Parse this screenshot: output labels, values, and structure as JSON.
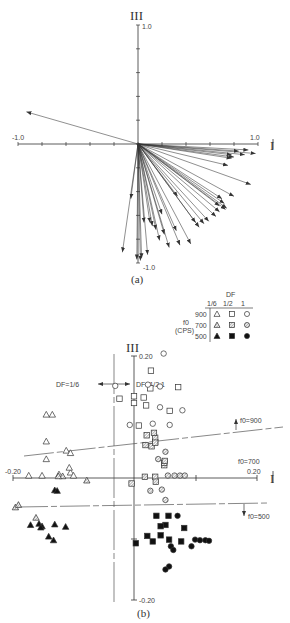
{
  "chart_data": [
    {
      "type": "vector",
      "panel": "(a)",
      "caption": "(a)",
      "xlabel": "I",
      "ylabel": "III",
      "xlim": [
        -1.0,
        1.0
      ],
      "ylim": [
        -1.0,
        1.0
      ],
      "x_ticks": [
        "-1.0",
        "1.0"
      ],
      "y_ticks": [
        "1.0",
        "-1.0"
      ],
      "tick_step": 0.2,
      "grid": false,
      "vectors": [
        [
          -0.93,
          0.27
        ],
        [
          0.92,
          -0.05
        ],
        [
          0.98,
          -0.08
        ],
        [
          0.84,
          -0.06
        ],
        [
          0.89,
          -0.09
        ],
        [
          0.78,
          -0.09
        ],
        [
          0.8,
          -0.11
        ],
        [
          0.78,
          -0.12
        ],
        [
          0.75,
          -0.18
        ],
        [
          0.94,
          -0.34
        ],
        [
          0.8,
          -0.44
        ],
        [
          0.7,
          -0.46
        ],
        [
          0.72,
          -0.5
        ],
        [
          0.73,
          -0.55
        ],
        [
          0.68,
          -0.52
        ],
        [
          0.74,
          -0.54
        ],
        [
          0.68,
          -0.57
        ],
        [
          0.65,
          -0.61
        ],
        [
          0.59,
          -0.65
        ],
        [
          0.55,
          -0.67
        ],
        [
          0.51,
          -0.7
        ],
        [
          0.48,
          -0.66
        ],
        [
          0.32,
          -0.73
        ],
        [
          0.26,
          -0.87
        ],
        [
          0.44,
          -0.84
        ],
        [
          0.35,
          -0.85
        ],
        [
          0.22,
          -0.76
        ],
        [
          0.18,
          -0.81
        ],
        [
          0.08,
          -0.93
        ],
        [
          0.05,
          -0.66
        ],
        [
          0.1,
          -0.66
        ],
        [
          0.12,
          -0.69
        ],
        [
          0.02,
          -0.98
        ],
        [
          0.03,
          -0.96
        ],
        [
          -0.01,
          -0.97
        ],
        [
          -0.06,
          -0.46
        ],
        [
          -0.13,
          -0.91
        ],
        [
          0.2,
          -0.59
        ],
        [
          0.33,
          -0.44
        ],
        [
          0.15,
          -0.72
        ]
      ]
    },
    {
      "type": "scatter",
      "panel": "(b)",
      "caption": "(b)",
      "xlabel": "I",
      "ylabel": "III",
      "xlim": [
        -0.2,
        0.2
      ],
      "ylim": [
        -0.2,
        0.2
      ],
      "x_ticks": [
        "-0.20",
        "0.20"
      ],
      "y_ticks": [
        "0.20",
        "-0.20"
      ],
      "grid": false,
      "legend": {
        "title_col": "DF",
        "title_row": "f0 (CPS)",
        "columns": [
          "1/6",
          "1/2",
          "1"
        ],
        "rows": [
          "900",
          "700",
          "500"
        ],
        "markers": {
          "1/6": "triangle",
          "1/2": "square",
          "1": "circle"
        },
        "fills": {
          "900": "open",
          "700": "hatched",
          "500": "filled"
        },
        "position": "upper right"
      },
      "annotations": [
        {
          "text": "DF=1/6",
          "type": "boundary-label"
        },
        {
          "text": "DF=1/2,1",
          "type": "boundary-label"
        },
        {
          "text": "f0=900",
          "type": "boundary-label"
        },
        {
          "text": "f0=700",
          "type": "boundary-label"
        },
        {
          "text": "f0=500",
          "type": "boundary-label"
        }
      ],
      "series": [
        {
          "name": "DF 1/6, f0 900",
          "marker": "triangle",
          "fill": "open",
          "points": [
            [
              -0.145,
              0.104
            ],
            [
              -0.135,
              0.104
            ],
            [
              -0.145,
              0.06
            ],
            [
              -0.112,
              0.045
            ],
            [
              -0.105,
              0.041
            ],
            [
              -0.145,
              0.031
            ],
            [
              -0.105,
              0.009
            ],
            [
              -0.107,
              0.017
            ],
            [
              -0.152,
              0.004
            ],
            [
              -0.124,
              0.006
            ],
            [
              -0.174,
              0.004
            ],
            [
              -0.1,
              0.004
            ]
          ]
        },
        {
          "name": "DF 1/6, f0 700",
          "marker": "triangle",
          "fill": "hatched",
          "points": [
            [
              -0.118,
              0.003
            ],
            [
              -0.125,
              0.003
            ],
            [
              -0.078,
              -0.004
            ],
            [
              -0.196,
              -0.048
            ],
            [
              -0.191,
              -0.044
            ],
            [
              -0.162,
              -0.065
            ]
          ]
        },
        {
          "name": "DF 1/6, f0 500",
          "marker": "triangle",
          "fill": "filled",
          "points": [
            [
              -0.131,
              -0.02
            ],
            [
              -0.127,
              -0.021
            ],
            [
              -0.171,
              -0.077
            ],
            [
              -0.157,
              -0.075
            ],
            [
              -0.152,
              -0.079
            ],
            [
              -0.131,
              -0.076
            ],
            [
              -0.113,
              -0.08
            ],
            [
              -0.133,
              -0.102
            ],
            [
              -0.141,
              -0.096
            ],
            [
              -0.154,
              -0.081
            ]
          ]
        },
        {
          "name": "DF 1/2, f0 900",
          "marker": "square",
          "fill": "open",
          "points": [
            [
              0.028,
              0.176
            ],
            [
              0.073,
              0.149
            ],
            [
              0.027,
              0.147
            ],
            [
              0.016,
              0.132
            ],
            [
              0.0,
              0.123
            ],
            [
              0.0,
              0.134
            ],
            [
              -0.024,
              0.13
            ],
            [
              0.02,
              0.119
            ],
            [
              0.059,
              0.11
            ],
            [
              0.008,
              0.086
            ]
          ]
        },
        {
          "name": "DF 1/2, f0 700",
          "marker": "square",
          "fill": "hatched",
          "points": [
            [
              0.021,
              0.07
            ],
            [
              0.035,
              0.059
            ],
            [
              0.035,
              0.066
            ],
            [
              0.033,
              0.074
            ],
            [
              0.019,
              0.054
            ],
            [
              0.029,
              0.052
            ],
            [
              0.035,
              0.058
            ],
            [
              0.035,
              0.002
            ],
            [
              0.018,
              0.002
            ],
            [
              0.05,
              0.021
            ],
            [
              0.05,
              0.025
            ],
            [
              0.051,
              0.028
            ],
            [
              0.036,
              -0.006
            ],
            [
              -0.004,
              -0.009
            ]
          ]
        },
        {
          "name": "DF 1/2, f0 500",
          "marker": "square",
          "fill": "filled",
          "points": [
            [
              0.037,
              -0.062
            ],
            [
              0.057,
              -0.062
            ],
            [
              0.052,
              -0.077
            ],
            [
              0.044,
              -0.079
            ],
            [
              0.044,
              -0.094
            ],
            [
              0.022,
              -0.095
            ],
            [
              0.078,
              -0.104
            ],
            [
              0.031,
              -0.104
            ],
            [
              0.058,
              -0.101
            ],
            [
              0.003,
              -0.107
            ],
            [
              0.083,
              -0.082
            ]
          ]
        },
        {
          "name": "DF 1, f0 900",
          "marker": "circle",
          "fill": "open",
          "points": [
            [
              0.049,
              0.204
            ],
            [
              0.043,
              0.15
            ],
            [
              0.023,
              0.153
            ],
            [
              -0.031,
              0.151
            ],
            [
              0.043,
              0.116
            ],
            [
              0.08,
              0.111
            ],
            [
              0.059,
              0.087
            ],
            [
              -0.007,
              0.087
            ],
            [
              0.031,
              0.089
            ]
          ]
        },
        {
          "name": "DF 1, f0 700",
          "marker": "circle",
          "fill": "hatched",
          "points": [
            [
              0.04,
              0.031
            ],
            [
              0.052,
              0.043
            ],
            [
              0.056,
              0.004
            ],
            [
              0.067,
              0.004
            ],
            [
              0.076,
              0.004
            ],
            [
              0.084,
              0.004
            ],
            [
              0.027,
              -0.021
            ],
            [
              0.046,
              -0.019
            ],
            [
              0.052,
              -0.036
            ]
          ]
        },
        {
          "name": "DF 1, f0 500",
          "marker": "circle",
          "fill": "filled",
          "points": [
            [
              0.072,
              -0.062
            ],
            [
              0.101,
              -0.101
            ],
            [
              0.109,
              -0.102
            ],
            [
              0.118,
              -0.102
            ],
            [
              0.124,
              -0.103
            ],
            [
              0.095,
              -0.112
            ],
            [
              0.061,
              -0.112
            ],
            [
              0.065,
              -0.118
            ],
            [
              0.058,
              -0.145
            ],
            [
              0.052,
              -0.15
            ]
          ]
        }
      ]
    }
  ],
  "panel_a": {
    "caption": "(a)",
    "axis_x_label": "I",
    "axis_y_label": "III",
    "x_min_label": "-1.0",
    "x_max_label": "1.0",
    "y_max_label": "1.0",
    "y_min_label": "-1.0"
  },
  "panel_b": {
    "caption": "(b)",
    "axis_x_label": "I",
    "axis_y_label": "III",
    "x_min_label": "-0.20",
    "x_max_label": "0.20",
    "y_max_label": "0.20",
    "y_min_label": "-0.20",
    "df_left_label": "DF=1/6",
    "df_right_label": "DF=1/2,1",
    "f0_900_label": "f0=900",
    "f0_700_label": "f0=700",
    "f0_500_label": "f0=500",
    "legend": {
      "df_title": "DF",
      "col_1": "1/6",
      "col_2": "1/2",
      "col_3": "1",
      "f0_label": "f0",
      "cps_label": "(CPS)",
      "row_1": "900",
      "row_2": "700",
      "row_3": "500"
    }
  }
}
